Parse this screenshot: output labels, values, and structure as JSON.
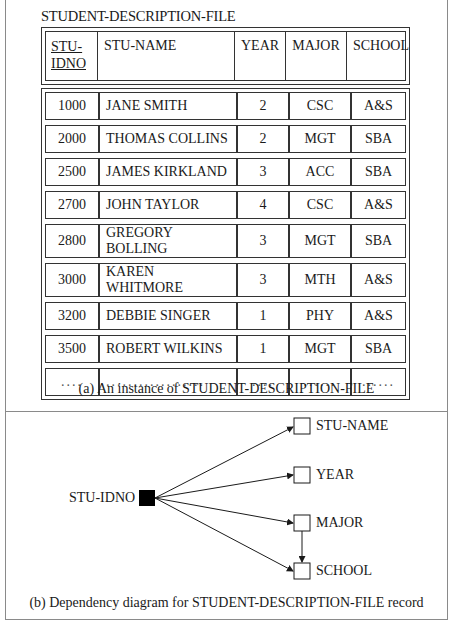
{
  "part_a": {
    "file_title": "STUDENT-DESCRIPTION-FILE",
    "header": {
      "stu_idno_line1": "STU-",
      "stu_idno_line2": "IDNO",
      "stu_name": "STU-NAME",
      "year": "YEAR",
      "major": "MAJOR",
      "school": "SCHOOL"
    },
    "rows": [
      {
        "id": "1000",
        "name": "JANE SMITH",
        "year": "2",
        "major": "CSC",
        "school": "A&S"
      },
      {
        "id": "2000",
        "name": "THOMAS COLLINS",
        "year": "2",
        "major": "MGT",
        "school": "SBA"
      },
      {
        "id": "2500",
        "name": "JAMES KIRKLAND",
        "year": "3",
        "major": "ACC",
        "school": "SBA"
      },
      {
        "id": "2700",
        "name": "JOHN TAYLOR",
        "year": "4",
        "major": "CSC",
        "school": "A&S"
      },
      {
        "id": "2800",
        "name": "GREGORY BOLLING",
        "year": "3",
        "major": "MGT",
        "school": "SBA"
      },
      {
        "id": "3000",
        "name": "KAREN WHITMORE",
        "year": "3",
        "major": "MTH",
        "school": "A&S"
      },
      {
        "id": "3200",
        "name": "DEBBIE SINGER",
        "year": "1",
        "major": "PHY",
        "school": "A&S"
      },
      {
        "id": "3500",
        "name": "ROBERT WILKINS",
        "year": "1",
        "major": "MGT",
        "school": "SBA"
      },
      {
        "id": "....",
        "name": "..................",
        "year": "....",
        "major": "......",
        "school": "......"
      }
    ],
    "caption": "(a) An instance of STUDENT-DESCRIPTION-FILE"
  },
  "part_b": {
    "source": "STU-IDNO",
    "targets": [
      "STU-NAME",
      "YEAR",
      "MAJOR",
      "SCHOOL"
    ],
    "edges": [
      {
        "from": "STU-IDNO",
        "to": "STU-NAME"
      },
      {
        "from": "STU-IDNO",
        "to": "YEAR"
      },
      {
        "from": "STU-IDNO",
        "to": "MAJOR"
      },
      {
        "from": "STU-IDNO",
        "to": "SCHOOL"
      },
      {
        "from": "MAJOR",
        "to": "SCHOOL"
      }
    ],
    "caption": "(b) Dependency diagram for STUDENT-DESCRIPTION-FILE record"
  }
}
